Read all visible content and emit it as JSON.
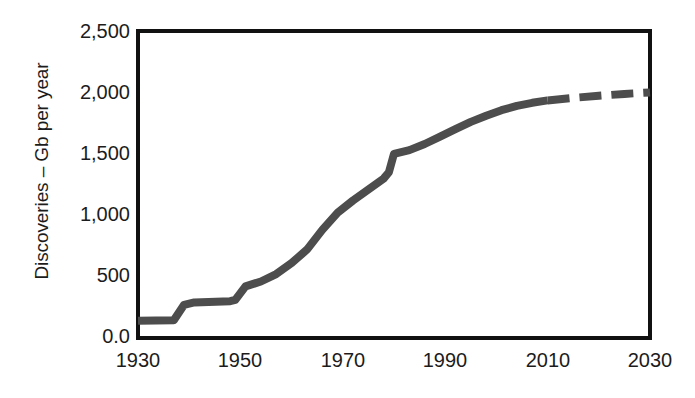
{
  "chart_data": {
    "type": "line",
    "title": "",
    "xlabel": "",
    "ylabel": "Discoveries – Gb per year",
    "xlim": [
      1930,
      2030
    ],
    "ylim": [
      0,
      2500
    ],
    "grid": false,
    "legend": "none",
    "x_ticks": [
      "1930",
      "1950",
      "1970",
      "1990",
      "2010",
      "2030"
    ],
    "x_tick_values": [
      1930,
      1950,
      1970,
      1990,
      2010,
      2030
    ],
    "y_ticks": [
      "0.0",
      "500",
      "1,000",
      "1,500",
      "2,000",
      "2,500"
    ],
    "y_tick_values": [
      0,
      500,
      1000,
      1500,
      2000,
      2500
    ],
    "series": [
      {
        "name": "Discovered (historic)",
        "style": "solid",
        "color": "#4d4d4d",
        "x": [
          1930,
          1937,
          1939,
          1941,
          1948,
          1949,
          1951,
          1954,
          1957,
          1960,
          1963,
          1966,
          1969,
          1972,
          1975,
          1978,
          1979,
          1980,
          1983,
          1986,
          1989,
          1992,
          1995,
          1998,
          2001,
          2004,
          2007,
          2010
        ],
        "values": [
          140,
          145,
          270,
          290,
          300,
          310,
          420,
          460,
          520,
          610,
          720,
          880,
          1020,
          1120,
          1210,
          1300,
          1350,
          1500,
          1530,
          1580,
          1640,
          1700,
          1760,
          1810,
          1855,
          1890,
          1915,
          1935
        ]
      },
      {
        "name": "Projected",
        "style": "dashed",
        "color": "#4d4d4d",
        "x": [
          2010,
          2015,
          2020,
          2025,
          2030
        ],
        "values": [
          1935,
          1955,
          1972,
          1988,
          2000
        ]
      }
    ],
    "annotations": [],
    "axis_color": "#111111",
    "text_color": "#1c1c1c",
    "background": "#ffffff"
  },
  "plot_frame": {
    "left": 138,
    "top": 31,
    "right": 650,
    "bottom": 338
  }
}
